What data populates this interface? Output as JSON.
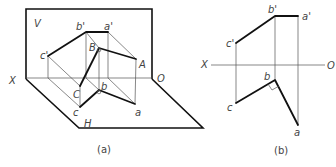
{
  "figure_a": {
    "caption": "(a)",
    "plane_labels": {
      "V": "V",
      "H": "H",
      "X": "X",
      "O": "O"
    },
    "point_labels": {
      "b_prime": "b'",
      "a_prime": "a'",
      "c_prime": "c'",
      "B": "B",
      "A": "A",
      "C": "C",
      "b": "b",
      "a": "a",
      "c": "c"
    }
  },
  "figure_b": {
    "caption": "(b)",
    "axis_labels": {
      "X": "X",
      "O": "O"
    },
    "point_labels": {
      "b_prime": "b'",
      "a_prime": "a'",
      "c_prime": "c'",
      "b": "b",
      "a": "a",
      "c": "c"
    }
  }
}
